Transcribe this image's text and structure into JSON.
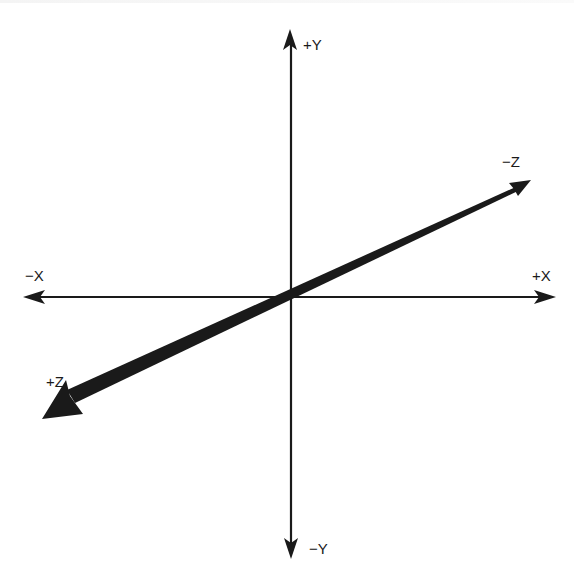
{
  "diagram": {
    "colors": {
      "background": "#ffffff",
      "axis": "#1a1a1a"
    },
    "origin": {
      "x": 291,
      "y": 297
    },
    "axes": [
      {
        "name": "x",
        "negative_label": "−X",
        "positive_label": "+X"
      },
      {
        "name": "y",
        "negative_label": "−Y",
        "positive_label": "+Y"
      },
      {
        "name": "z",
        "negative_label": "−Z",
        "positive_label": "+Z"
      }
    ],
    "labels": {
      "plus_y": "+Y",
      "minus_y": "−Y",
      "plus_x": "+X",
      "minus_x": "−X",
      "plus_z": "+Z",
      "minus_z": "−Z"
    }
  }
}
